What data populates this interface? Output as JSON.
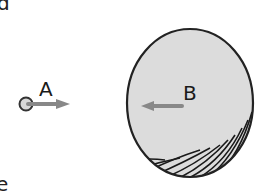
{
  "figure": {
    "cut_text_top": "d",
    "cut_text_bottom": "e",
    "body_a": {
      "label": "A",
      "arrow_direction": "right",
      "fill_color": "#d8d8d8",
      "outline_color": "#333333",
      "arrow_color": "#888888"
    },
    "body_b": {
      "label": "B",
      "arrow_direction": "left",
      "fill_color": "#dcdcdc",
      "outline_color": "#222222",
      "arrow_color": "#888888"
    }
  }
}
